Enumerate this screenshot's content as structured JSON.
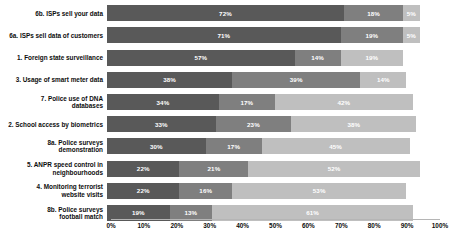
{
  "chart_data": {
    "type": "bar",
    "orientation": "horizontal",
    "stacked": true,
    "title": "",
    "subtitle": "",
    "xlabel": "",
    "ylabel": "",
    "xlim": [
      0,
      100
    ],
    "xticks": [
      "0%",
      "10%",
      "20%",
      "30%",
      "40%",
      "50%",
      "60%",
      "70%",
      "80%",
      "90%",
      "100%"
    ],
    "xtick_values": [
      0,
      10,
      20,
      30,
      40,
      50,
      60,
      70,
      80,
      90,
      100
    ],
    "grid": false,
    "legend": "none",
    "categories": [
      "6b. ISPs sell your data",
      "6a. ISPs sell data of customers",
      "1. Foreign state surveillance",
      "3. Usage of smart meter data",
      "7. Police use of DNA\ndatabases",
      "2. School access by biometrics",
      "8a. Police surveys\ndemonstration",
      "5. ANPR speed control in\nneighbourhoods",
      "4. Monitoring terrorist\nwebsite visits",
      "8b. Police surveys\nfootball match"
    ],
    "series": [
      {
        "name": "segment-1",
        "color": "#595959",
        "values": [
          72,
          71,
          57,
          38,
          34,
          33,
          30,
          22,
          22,
          19
        ],
        "labels": [
          "72%",
          "71%",
          "57%",
          "38%",
          "34%",
          "33%",
          "30%",
          "22%",
          "22%",
          "19%"
        ]
      },
      {
        "name": "segment-2",
        "color": "#7f7f7f",
        "values": [
          18,
          19,
          14,
          39,
          17,
          23,
          17,
          21,
          16,
          13
        ],
        "labels": [
          "18%",
          "19%",
          "14%",
          "39%",
          "17%",
          "23%",
          "17%",
          "21%",
          "16%",
          "13%"
        ]
      },
      {
        "name": "segment-3",
        "color": "#bfbfbf",
        "values": [
          5,
          5,
          19,
          14,
          42,
          38,
          45,
          52,
          53,
          61
        ],
        "labels": [
          "5%",
          "5%",
          "19%",
          "14%",
          "42%",
          "38%",
          "45%",
          "52%",
          "53%",
          "61%"
        ]
      }
    ]
  }
}
